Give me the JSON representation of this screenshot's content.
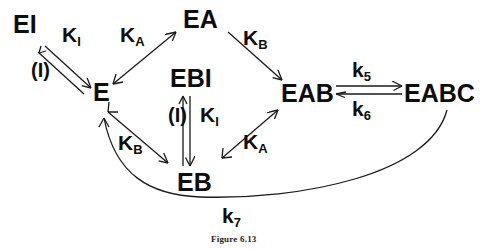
{
  "figure": {
    "caption": "Figure 6.13",
    "stroke_color": "#1a1a1a",
    "text_color": "#0d0d0d"
  },
  "nodes": [
    {
      "id": "EI",
      "label": "EI",
      "x": 13,
      "y": 12
    },
    {
      "id": "E",
      "label": "E",
      "x": 93,
      "y": 80
    },
    {
      "id": "EA",
      "label": "EA",
      "x": 183,
      "y": 7
    },
    {
      "id": "EBI",
      "label": "EBI",
      "x": 170,
      "y": 66
    },
    {
      "id": "EB",
      "label": "EB",
      "x": 177,
      "y": 170
    },
    {
      "id": "EAB",
      "label": "EAB",
      "x": 281,
      "y": 81
    },
    {
      "id": "EABC",
      "label": "EABC",
      "x": 404,
      "y": 81
    }
  ],
  "edge_labels": [
    {
      "id": "KI-top",
      "base": "K",
      "sub": "I",
      "x": 62,
      "y": 24
    },
    {
      "id": "I-top",
      "text": "(I)",
      "x": 31,
      "y": 60
    },
    {
      "id": "KA-top",
      "base": "K",
      "sub": "A",
      "x": 120,
      "y": 24
    },
    {
      "id": "KB-top",
      "base": "K",
      "sub": "B",
      "x": 243,
      "y": 27
    },
    {
      "id": "KB-bot",
      "base": "K",
      "sub": "B",
      "x": 118,
      "y": 132
    },
    {
      "id": "I-bottom",
      "text": "(I)",
      "x": 168,
      "y": 105
    },
    {
      "id": "KI-bot",
      "base": "K",
      "sub": "I",
      "x": 200,
      "y": 104
    },
    {
      "id": "KA-bot",
      "base": "K",
      "sub": "A",
      "x": 243,
      "y": 131
    },
    {
      "id": "k5",
      "base": "k",
      "sub": "5",
      "x": 352,
      "y": 59
    },
    {
      "id": "k6",
      "base": "k",
      "sub": "6",
      "x": 352,
      "y": 98
    },
    {
      "id": "k7",
      "base": "k",
      "sub": "7",
      "x": 222,
      "y": 205
    }
  ],
  "caption_position": {
    "x": 211,
    "y": 234
  }
}
